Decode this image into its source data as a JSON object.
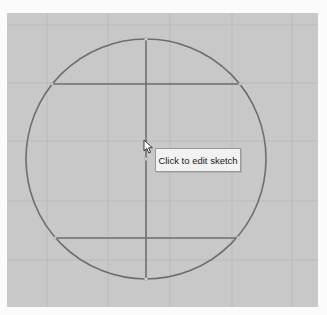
{
  "viewport": {
    "canvas_bg": "#c8c8c8",
    "page_bg": "#fbfbfb",
    "grid_color": "#b4b4b4",
    "sketch_color": "#6e6e6e"
  },
  "sketch": {
    "circle": {
      "cx": 146,
      "cy": 159,
      "r": 120
    },
    "vertical_line": {
      "x": 146,
      "y1": 39,
      "y2": 279
    },
    "upper_chord": {
      "y": 84,
      "x1": 52,
      "x2": 240
    },
    "lower_chord": {
      "y": 238,
      "x1": 55,
      "x2": 238
    }
  },
  "grid": {
    "vertical_x": [
      47,
      108,
      170,
      232,
      292
    ],
    "horizontal_y": [
      25,
      83,
      141,
      201,
      260
    ]
  },
  "tooltip": {
    "text": "Click to edit sketch"
  },
  "cursor": {
    "type": "arrow-pointer"
  }
}
